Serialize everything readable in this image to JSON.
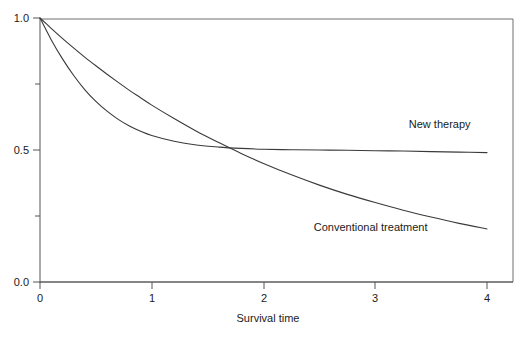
{
  "chart_data": {
    "type": "line",
    "title": "",
    "subtitle": "",
    "xlabel": "Survival time",
    "ylabel": "",
    "xlim": [
      0,
      4
    ],
    "ylim": [
      0.0,
      1.0
    ],
    "grid": false,
    "legend_position": "inline-annotation",
    "x_ticks": [
      {
        "value": 0,
        "label": "0",
        "major": true
      },
      {
        "value": 1,
        "label": "1",
        "major": true
      },
      {
        "value": 2,
        "label": "2",
        "major": true
      },
      {
        "value": 3,
        "label": "3",
        "major": true
      },
      {
        "value": 4,
        "label": "4",
        "major": true
      }
    ],
    "y_ticks": [
      {
        "value": 0.0,
        "label": "0.0",
        "major": true
      },
      {
        "value": 0.25,
        "label": "",
        "major": false
      },
      {
        "value": 0.5,
        "label": "0.5",
        "major": true
      },
      {
        "value": 0.75,
        "label": "",
        "major": false
      },
      {
        "value": 1.0,
        "label": "1.0",
        "major": true
      }
    ],
    "annotations": [
      {
        "name": "new-therapy-label",
        "text": "New therapy",
        "x": 3.3,
        "y": 0.585
      },
      {
        "name": "conventional-treatment-label",
        "text": "Conventional treatment",
        "x": 2.45,
        "y": 0.195
      }
    ],
    "series": [
      {
        "name": "New therapy",
        "x": [
          0.0,
          0.1,
          0.2,
          0.3,
          0.4,
          0.5,
          0.6,
          0.7,
          0.8,
          0.9,
          1.0,
          1.2,
          1.4,
          1.6,
          1.8,
          2.0,
          2.25,
          2.5,
          2.75,
          3.0,
          3.25,
          3.5,
          3.75,
          4.0
        ],
        "values": [
          1.0,
          0.918,
          0.846,
          0.783,
          0.729,
          0.684,
          0.647,
          0.616,
          0.591,
          0.571,
          0.555,
          0.533,
          0.519,
          0.511,
          0.506,
          0.503,
          0.501,
          0.5,
          0.499,
          0.497,
          0.496,
          0.494,
          0.492,
          0.49
        ]
      },
      {
        "name": "Conventional treatment",
        "x": [
          0.0,
          0.1,
          0.2,
          0.3,
          0.4,
          0.5,
          0.6,
          0.7,
          0.8,
          0.9,
          1.0,
          1.2,
          1.4,
          1.6,
          1.8,
          2.0,
          2.25,
          2.5,
          2.75,
          3.0,
          3.25,
          3.5,
          3.75,
          4.0
        ],
        "values": [
          1.0,
          0.961,
          0.923,
          0.887,
          0.852,
          0.819,
          0.787,
          0.756,
          0.726,
          0.698,
          0.67,
          0.619,
          0.571,
          0.528,
          0.487,
          0.449,
          0.406,
          0.367,
          0.332,
          0.301,
          0.272,
          0.246,
          0.222,
          0.201
        ]
      }
    ],
    "crossing_point": {
      "x": 1.62,
      "y": 0.513
    }
  },
  "axes": {
    "x_axis_label": "Survival time"
  },
  "colors": {
    "curve": "#3a3a3a",
    "axis": "#555555",
    "frame": "#6e6e6e",
    "background": "#ffffff",
    "text": "#1a1a1a"
  }
}
